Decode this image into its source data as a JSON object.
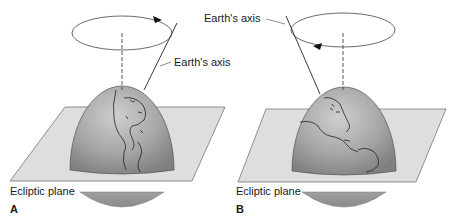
{
  "figure": {
    "panels": [
      {
        "id": "A",
        "letter": "A",
        "axis_label": "Earth's axis",
        "plane_label": "Ecliptic plane",
        "rotation_direction": "clockwise-arrow-right"
      },
      {
        "id": "B",
        "letter": "B",
        "axis_label": "Earth's axis",
        "plane_label": "Ecliptic plane",
        "rotation_direction": "arrow-left"
      }
    ],
    "colors": {
      "globe": "#9a9a9a",
      "globe_highlight": "#c4c4c4",
      "plane": "#dcdcdc",
      "line": "#333333"
    }
  }
}
